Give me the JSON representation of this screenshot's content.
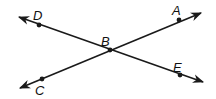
{
  "diagram": {
    "type": "intersecting-lines",
    "stroke_color": "#1a1a1a",
    "background": "#ffffff",
    "points": [
      {
        "id": "D",
        "label": "D",
        "x": 39,
        "y": 25,
        "label_x": 33,
        "label_y": 20
      },
      {
        "id": "A",
        "label": "A",
        "x": 179,
        "y": 20,
        "label_x": 172,
        "label_y": 15
      },
      {
        "id": "B",
        "label": "B",
        "x": 110,
        "y": 50,
        "label_x": 101,
        "label_y": 46
      },
      {
        "id": "C",
        "label": "C",
        "x": 42,
        "y": 79,
        "label_x": 35,
        "label_y": 95
      },
      {
        "id": "E",
        "label": "E",
        "x": 180,
        "y": 75,
        "label_x": 173,
        "label_y": 72
      }
    ],
    "lines": [
      {
        "name": "line-DE",
        "through": [
          "D",
          "B",
          "E"
        ],
        "x1": 19,
        "y1": 17,
        "x2": 203,
        "y2": 82
      },
      {
        "name": "line-CA",
        "through": [
          "C",
          "B",
          "A"
        ],
        "x1": 20,
        "y1": 88,
        "x2": 201,
        "y2": 13
      }
    ]
  }
}
